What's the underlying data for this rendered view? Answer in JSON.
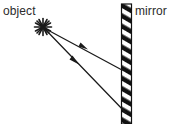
{
  "figure": {
    "type": "ray-diagram",
    "background_color": "#ffffff",
    "ink_color": "#1a1a1a",
    "text_color": "#2b2b2b",
    "width": 170,
    "height": 124
  },
  "labels": {
    "object": "object",
    "mirror": "mirror"
  },
  "object_source": {
    "name": "object",
    "glyph": "asterisk-starburst",
    "x": 43,
    "y": 27,
    "spoke_count": 10,
    "radius": 9
  },
  "mirror": {
    "name": "mirror",
    "style": "diagonal-hatched-bar",
    "x_left": 121.5,
    "x_right": 131.5,
    "y_top": 4,
    "y_bottom": 124,
    "hatch_angle_deg": 60,
    "hatch_color": "#111111",
    "gap_color": "#ffffff"
  },
  "rays": [
    {
      "name": "upper-incident-ray",
      "from_x": 43,
      "from_y": 27,
      "to_x": 122,
      "to_y": 70,
      "arrow_x": 84,
      "arrow_y": 47,
      "arrow_direction": "toward-mirror"
    },
    {
      "name": "lower-incident-ray",
      "from_x": 43,
      "from_y": 27,
      "to_x": 126,
      "to_y": 112,
      "arrow_x": 75,
      "arrow_y": 60,
      "arrow_direction": "toward-mirror"
    }
  ]
}
